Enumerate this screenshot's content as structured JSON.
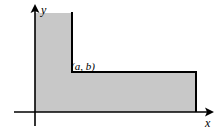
{
  "figure": {
    "background_color": "#ffffff",
    "shade_color": "#c8c8c8",
    "line_color": "#000000",
    "axes": {
      "x_axis_label": "x",
      "y_axis_label": "y",
      "x_axis_label_position": {
        "x": 207,
        "y": 126
      },
      "y_axis_label_position": {
        "x": 41,
        "y": 13
      },
      "origin": {
        "x": 35,
        "y": 112
      },
      "x_axis_start": {
        "x": 14,
        "y": 112
      },
      "x_axis_end": {
        "x": 213,
        "y": 112
      },
      "y_axis_start": {
        "x": 35,
        "y": 126
      },
      "y_axis_end": {
        "x": 35,
        "y": 5
      },
      "x_arrowhead": true,
      "y_arrowhead": true
    },
    "point": {
      "label": "(a, b)",
      "label_position": {
        "x": 72,
        "y": 70
      },
      "corner": {
        "x": 72,
        "y": 72
      }
    },
    "region": {
      "description": "Union of a vertical strip and a horizontal strip meeting at the corner (a, b)",
      "vertical_strip": {
        "left": 35,
        "right": 72,
        "top": 13,
        "bottom": 112
      },
      "horizontal_strip": {
        "left": 35,
        "right": 196,
        "top": 72,
        "bottom": 112
      },
      "outline_points": "35,13 72,13 72,72 196,72 196,112 35,112",
      "solid_boundaries": [
        "vertical segment from (72,13) to (72,72)",
        "horizontal segment from (72,72) to (196,72)",
        "right vertical segment from (196,72) to (196,112)"
      ]
    }
  }
}
